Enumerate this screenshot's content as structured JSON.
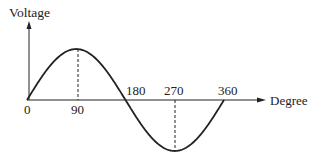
{
  "diagram": {
    "y_axis_label": "Voltage",
    "x_axis_label": "Degree",
    "ticks": [
      {
        "label": "0",
        "deg": 0,
        "pos": "below"
      },
      {
        "label": "90",
        "deg": 90,
        "pos": "below"
      },
      {
        "label": "180",
        "deg": 180,
        "pos": "above"
      },
      {
        "label": "270",
        "deg": 270,
        "pos": "above"
      },
      {
        "label": "360",
        "deg": 360,
        "pos": "above"
      }
    ],
    "dashed_guides_at_deg": [
      90,
      270
    ],
    "colors": {
      "line": "#222222",
      "background": "#ffffff"
    }
  },
  "chart_data": {
    "type": "line",
    "title": "",
    "xlabel": "Degree",
    "ylabel": "Voltage",
    "x": [
      0,
      90,
      180,
      270,
      360
    ],
    "series": [
      {
        "name": "sine",
        "values": [
          0,
          1,
          0,
          -1,
          0
        ]
      }
    ],
    "xlim": [
      0,
      360
    ],
    "grid": false
  }
}
